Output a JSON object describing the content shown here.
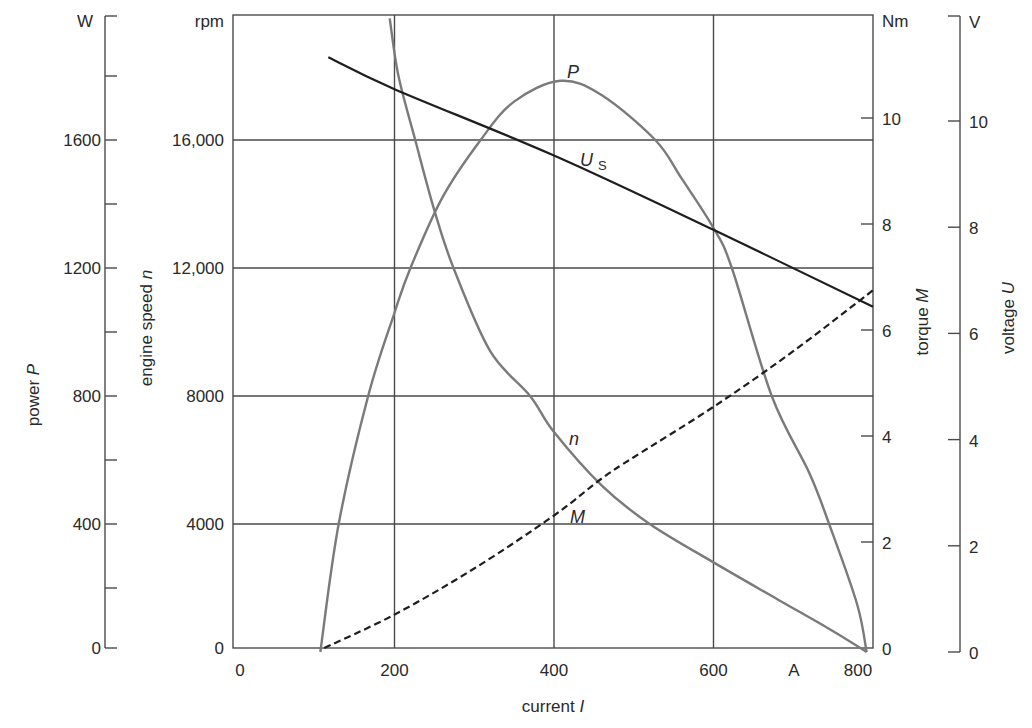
{
  "chart_data": {
    "type": "line",
    "title": "",
    "xlabel": "current I",
    "x_unit": "A",
    "xlim": [
      0,
      800
    ],
    "x_ticks": [
      0,
      200,
      400,
      600,
      800
    ],
    "grid": true,
    "axes": {
      "power": {
        "label": "power P",
        "unit": "W",
        "range": [
          0,
          1800
        ],
        "ticks": [
          0,
          400,
          800,
          1200,
          1600
        ],
        "minor_ticks": [
          200,
          600,
          1000,
          1400,
          1800
        ]
      },
      "speed": {
        "label": "engine speed n",
        "unit": "rpm",
        "range": [
          0,
          18000
        ],
        "ticks": [
          0,
          4000,
          8000,
          12000,
          16000
        ],
        "tick_labels": [
          "0",
          "4000",
          "8000",
          "12,000",
          "16,000"
        ]
      },
      "torque": {
        "label": "torque M",
        "unit": "Nm",
        "range": [
          0,
          11.5
        ],
        "ticks": [
          0,
          2,
          4,
          6,
          8,
          10
        ]
      },
      "voltage": {
        "label": "voltage U",
        "unit": "V",
        "range": [
          0,
          11.5
        ],
        "ticks": [
          0,
          2,
          4,
          6,
          8,
          10
        ]
      }
    },
    "series": [
      {
        "name": "P",
        "label": "P",
        "axis": "power",
        "style": "solid-gray",
        "x": [
          107,
          130,
          167,
          200,
          220,
          260,
          308,
          350,
          408,
          460,
          527,
          560,
          600,
          623,
          673,
          720,
          745,
          780,
          792
        ],
        "values": [
          0,
          400,
          800,
          1060,
          1200,
          1420,
          1600,
          1720,
          1785,
          1740,
          1600,
          1480,
          1325,
          1200,
          800,
          560,
          400,
          150,
          0
        ]
      },
      {
        "name": "n",
        "label": "n",
        "axis": "speed",
        "style": "solid-gray",
        "x": [
          194,
          205,
          226,
          250,
          274,
          320,
          370,
          400,
          460,
          520,
          600,
          680,
          750,
          792
        ],
        "values": [
          19800,
          18000,
          16000,
          13800,
          12000,
          9400,
          8000,
          6875,
          5200,
          4000,
          2800,
          1650,
          650,
          0
        ]
      },
      {
        "name": "M",
        "label": "M",
        "axis": "torque",
        "style": "dashed-black",
        "x": [
          112,
          200,
          300,
          400,
          460,
          500,
          600,
          700,
          800
        ],
        "values": [
          0,
          0.63,
          1.5,
          2.5,
          3.2,
          3.6,
          4.55,
          5.6,
          6.75
        ]
      },
      {
        "name": "Us",
        "label": "U_S",
        "axis": "voltage",
        "style": "solid-black",
        "x": [
          117,
          200,
          400,
          600,
          800
        ],
        "values": [
          11.2,
          10.6,
          9.35,
          7.95,
          6.5
        ]
      }
    ],
    "annotations": [
      {
        "text": "P",
        "near_x": 420,
        "near_value_axis": "power"
      },
      {
        "text": "U_S",
        "near_x": 430
      },
      {
        "text": "n",
        "near_x": 425
      },
      {
        "text": "M",
        "near_x": 430
      }
    ]
  },
  "labels": {
    "power_unit": "W",
    "speed_unit": "rpm",
    "torque_unit": "Nm",
    "voltage_unit": "V",
    "x_unit": "A",
    "power_title": "power",
    "power_var": "P",
    "speed_title": "engine speed",
    "speed_var": "n",
    "torque_title": "torque",
    "torque_var": "M",
    "voltage_title": "voltage",
    "voltage_var": "U",
    "x_title": "current",
    "x_var": "I",
    "curve_P": "P",
    "curve_n": "n",
    "curve_M": "M",
    "curve_U": "U",
    "curve_U_sub": "S"
  },
  "colors": {
    "grid": "#4a4a4a",
    "axis": "#4a4a4a",
    "curve_gray": "#7a7a7a",
    "curve_black": "#1e1e1e"
  }
}
